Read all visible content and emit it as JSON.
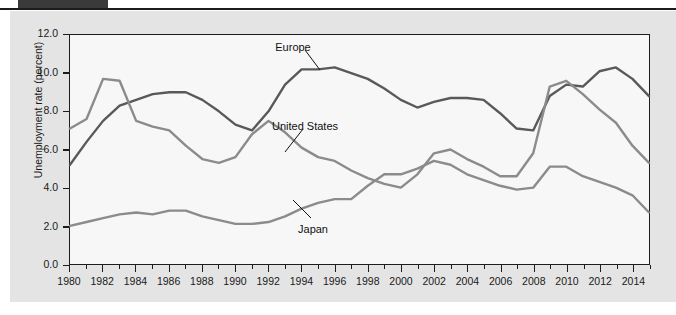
{
  "figure": {
    "header_tab_color": "#3a3a3a",
    "panel_color": "#e4e4e4",
    "plot_background": "#f7f7f7",
    "axis_color": "#1d1d1d"
  },
  "chart_data": {
    "type": "line",
    "title": "",
    "xlabel": "",
    "ylabel": "Unemployment rate (percent)",
    "xlim": [
      1980,
      2015
    ],
    "ylim": [
      0.0,
      12.0
    ],
    "ytick_labels": [
      "0.0",
      "2.0",
      "4.0",
      "6.0",
      "8.0",
      "10.0",
      "12.0"
    ],
    "ytick_values": [
      0.0,
      2.0,
      4.0,
      6.0,
      8.0,
      10.0,
      12.0
    ],
    "xtick_labels": [
      "1980",
      "1982",
      "1984",
      "1986",
      "1988",
      "1990",
      "1992",
      "1994",
      "1996",
      "1998",
      "2000",
      "2002",
      "2004",
      "2006",
      "2008",
      "2010",
      "2012",
      "2014"
    ],
    "xtick_values": [
      1980,
      1982,
      1984,
      1986,
      1988,
      1990,
      1992,
      1994,
      1996,
      1998,
      2000,
      2002,
      2004,
      2006,
      2008,
      2010,
      2012,
      2014
    ],
    "grid": false,
    "legend": "inline-annotations",
    "x": [
      1980,
      1981,
      1982,
      1983,
      1984,
      1985,
      1986,
      1987,
      1988,
      1989,
      1990,
      1991,
      1992,
      1993,
      1994,
      1995,
      1996,
      1997,
      1998,
      1999,
      2000,
      2001,
      2002,
      2003,
      2004,
      2005,
      2006,
      2007,
      2008,
      2009,
      2010,
      2011,
      2012,
      2013,
      2014,
      2015
    ],
    "series": [
      {
        "name": "Europe",
        "color": "#595959",
        "values": [
          5.2,
          6.4,
          7.5,
          8.3,
          8.6,
          8.9,
          9.0,
          9.0,
          8.6,
          8.0,
          7.3,
          7.0,
          8.0,
          9.4,
          10.2,
          10.2,
          10.3,
          10.0,
          9.7,
          9.2,
          8.6,
          8.2,
          8.5,
          8.7,
          8.7,
          8.6,
          7.9,
          7.1,
          7.0,
          8.8,
          9.4,
          9.3,
          10.1,
          10.3,
          9.7,
          8.8
        ]
      },
      {
        "name": "United States",
        "color": "#8b8b8b",
        "values": [
          7.1,
          7.6,
          9.7,
          9.6,
          7.5,
          7.2,
          7.0,
          6.2,
          5.5,
          5.3,
          5.6,
          6.8,
          7.5,
          6.9,
          6.1,
          5.6,
          5.4,
          4.9,
          4.5,
          4.2,
          4.0,
          4.7,
          5.8,
          6.0,
          5.5,
          5.1,
          4.6,
          4.6,
          5.8,
          9.3,
          9.6,
          8.9,
          8.1,
          7.4,
          6.2,
          5.3
        ]
      },
      {
        "name": "Japan",
        "color": "#8b8b8b",
        "values": [
          2.0,
          2.2,
          2.4,
          2.6,
          2.7,
          2.6,
          2.8,
          2.8,
          2.5,
          2.3,
          2.1,
          2.1,
          2.2,
          2.5,
          2.9,
          3.2,
          3.4,
          3.4,
          4.1,
          4.7,
          4.7,
          5.0,
          5.4,
          5.2,
          4.7,
          4.4,
          4.1,
          3.9,
          4.0,
          5.1,
          5.1,
          4.6,
          4.3,
          4.0,
          3.6,
          2.7
        ]
      }
    ],
    "annotations": [
      {
        "label": "Europe",
        "x_px": 293,
        "y_px": 42
      },
      {
        "label": "United States",
        "x_px": 305,
        "y_px": 121
      },
      {
        "label": "Japan",
        "x_px": 313,
        "y_px": 224
      }
    ]
  }
}
